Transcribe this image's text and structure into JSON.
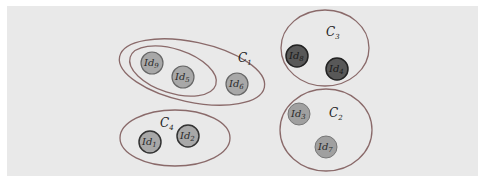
{
  "colors": {
    "background": "#e9e9e9",
    "outline": "#8a6a6a",
    "node_light": "#a8a8a8",
    "node_dark": "#585858",
    "node_stroke": "#3a3a3a"
  },
  "clusters": [
    {
      "id": "C1",
      "label": "C",
      "sub": "1",
      "members": [
        "Id9",
        "Id5",
        "Id6"
      ],
      "note": "contains nested group {Id9, Id5}"
    },
    {
      "id": "C2",
      "label": "C",
      "sub": "2",
      "members": [
        "Id3",
        "Id7"
      ]
    },
    {
      "id": "C3",
      "label": "C",
      "sub": "3",
      "members": [
        "Id8",
        "Id4"
      ]
    },
    {
      "id": "C4",
      "label": "C",
      "sub": "4",
      "members": [
        "Id1",
        "Id2"
      ]
    }
  ],
  "nodes": {
    "id9": {
      "label": "Id",
      "sub": "9"
    },
    "id5": {
      "label": "Id",
      "sub": "5"
    },
    "id6": {
      "label": "Id",
      "sub": "6"
    },
    "id1": {
      "label": "Id",
      "sub": "1"
    },
    "id2": {
      "label": "Id",
      "sub": "2"
    },
    "id8": {
      "label": "Id",
      "sub": "8"
    },
    "id4": {
      "label": "Id",
      "sub": "4"
    },
    "id3": {
      "label": "Id",
      "sub": "3"
    },
    "id7": {
      "label": "Id",
      "sub": "7"
    }
  }
}
